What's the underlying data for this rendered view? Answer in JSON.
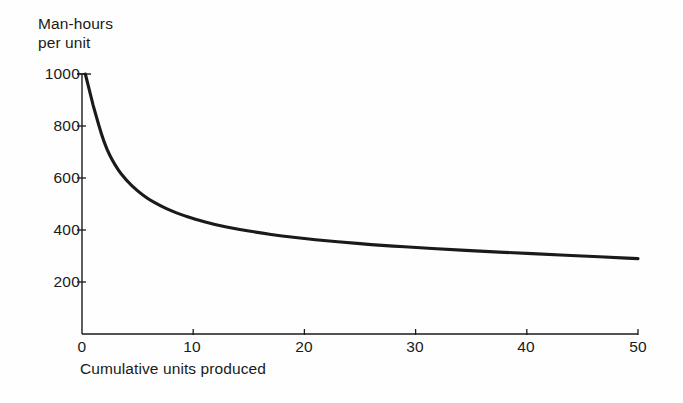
{
  "chart_data": {
    "type": "line",
    "title": "",
    "ylabel": "Man-hours\nper unit",
    "xlabel": "Cumulative units produced",
    "xlim": [
      0,
      50
    ],
    "ylim": [
      0,
      1000
    ],
    "xticks": [
      0,
      10,
      20,
      30,
      40,
      50
    ],
    "xtick_labels": [
      "0",
      "10",
      "20",
      "30",
      "40",
      "50"
    ],
    "yticks": [
      200,
      400,
      600,
      800,
      1000
    ],
    "ytick_labels": [
      "200",
      "400",
      "600",
      "800",
      "1000"
    ],
    "grid": false,
    "legend": "none",
    "series": [
      {
        "name": "Learning curve",
        "color": "#1a1a1a",
        "x": [
          0.3,
          1,
          2,
          3,
          4,
          5,
          6,
          7,
          8,
          9,
          10,
          12,
          14,
          16,
          18,
          20,
          22,
          24,
          26,
          28,
          30,
          33,
          36,
          39,
          42,
          45,
          48,
          50
        ],
        "y": [
          1000,
          880,
          730,
          645,
          590,
          550,
          518,
          494,
          474,
          458,
          444,
          420,
          403,
          389,
          377,
          367,
          358,
          351,
          344,
          338,
          333,
          325,
          318,
          312,
          306,
          300,
          294,
          290
        ]
      }
    ],
    "annotations": []
  },
  "axis": {
    "y_label_text": "Man-hours\nper unit",
    "x_label_text": "Cumulative units produced",
    "y_ticks": [
      "1000",
      "800",
      "600",
      "400",
      "200"
    ],
    "x_ticks": [
      "0",
      "10",
      "20",
      "30",
      "40",
      "50"
    ],
    "axis_color": "#1a1a1a"
  }
}
